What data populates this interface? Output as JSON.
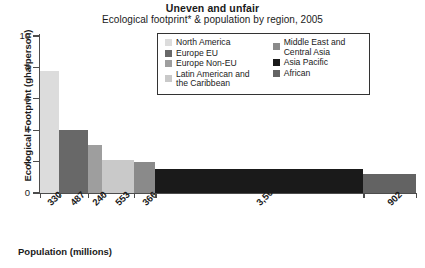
{
  "chart_data": {
    "type": "bar",
    "title": "Uneven and unfair",
    "subtitle": "Ecological footprint* & population by region, 2005",
    "xlabel": "Population (millions)",
    "ylabel": "Ecological Footprint (gha/person)",
    "ylim": [
      0,
      10
    ],
    "ytick_values": [
      10,
      8,
      6,
      4,
      2,
      0
    ],
    "ytick_labels": [
      "10",
      "8",
      "6",
      "4",
      "2",
      "0"
    ],
    "grid": false,
    "legend_position": "upper-center",
    "note": "Bar widths are proportional to population; bar heights are ecological footprint per person.",
    "categories": [
      "North America",
      "Europe EU",
      "Europe Non-EU",
      "Latin American and the Caribbean",
      "Middle East and Central Asia",
      "Asia Pacific",
      "African"
    ],
    "x": [
      330,
      487,
      240,
      553,
      366,
      3562,
      902
    ],
    "xtick_labels": [
      "330",
      "487",
      "240",
      "553",
      "366",
      "3,562",
      "902"
    ],
    "values": [
      7.8,
      4.0,
      3.05,
      2.1,
      2.0,
      1.5,
      1.2
    ],
    "colors": [
      "#dcdcdc",
      "#686868",
      "#9e9e9e",
      "#c9c9c9",
      "#8a8a8a",
      "#1a1a1a",
      "#636363"
    ]
  },
  "legend": {
    "left_column": [
      {
        "label": "North America",
        "color": "#dcdcdc"
      },
      {
        "label": "Europe EU",
        "color": "#686868"
      },
      {
        "label": "Europe Non-EU",
        "color": "#9e9e9e"
      },
      {
        "label": "Latin American and\nthe Caribbean",
        "color": "#c9c9c9"
      }
    ],
    "right_column": [
      {
        "label": "Middle East and\nCentral Asia",
        "color": "#8a8a8a"
      },
      {
        "label": "Asia Pacific",
        "color": "#1a1a1a"
      },
      {
        "label": "African",
        "color": "#636363"
      }
    ]
  }
}
